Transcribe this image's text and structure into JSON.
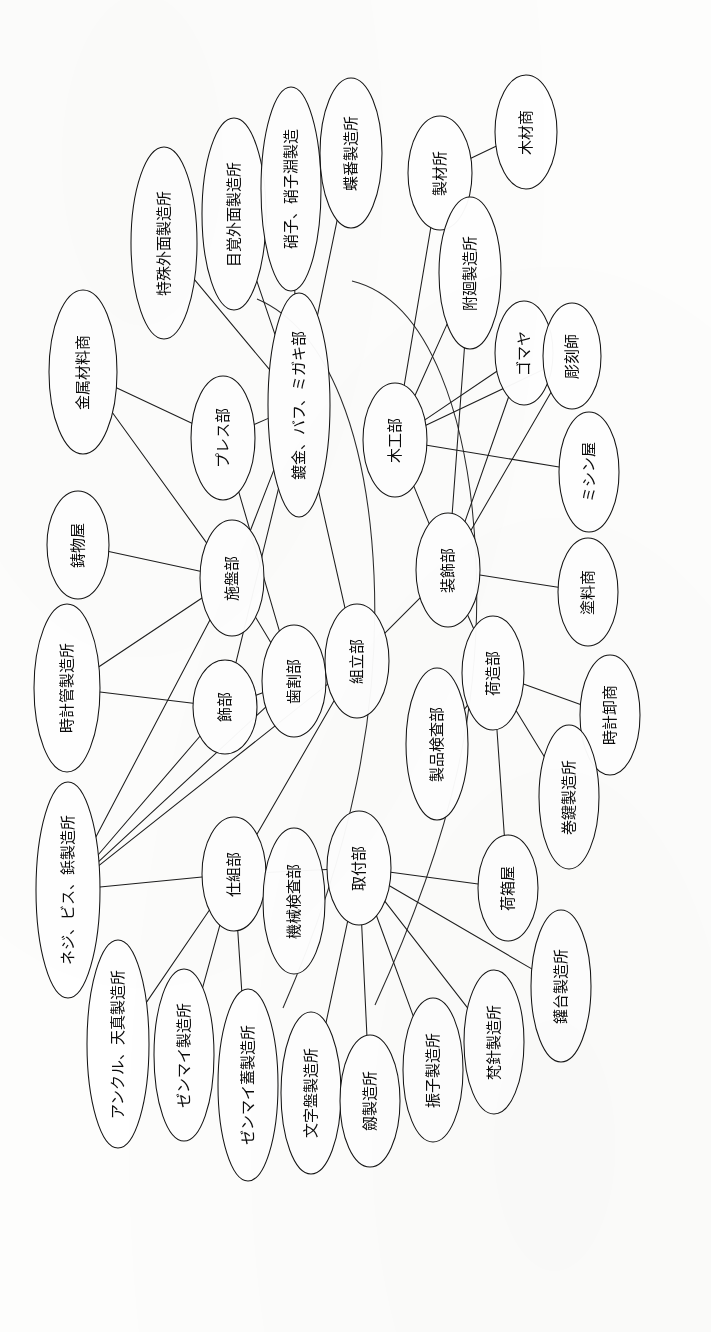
{
  "document": {
    "kind": "network-diagram",
    "orientation": "text-rotated-90-ccw",
    "background_color": "#fdfdfc",
    "ink_color": "#141414"
  },
  "chart_data": {
    "type": "diagram",
    "title": "",
    "nodes": [
      {
        "id": "n01",
        "label": "金属材料商",
        "cx": 83,
        "cy": 372,
        "rx": 34,
        "ry": 82,
        "fs": 15
      },
      {
        "id": "n02",
        "label": "特殊外面製造所",
        "cx": 164,
        "cy": 243,
        "rx": 33,
        "ry": 96,
        "fs": 15
      },
      {
        "id": "n03",
        "label": "目覚外面製造所",
        "cx": 234,
        "cy": 214,
        "rx": 32,
        "ry": 96,
        "fs": 15
      },
      {
        "id": "n04",
        "label": "硝子、硝子淵製造",
        "cx": 291,
        "cy": 189,
        "rx": 30,
        "ry": 102,
        "fs": 15
      },
      {
        "id": "n05",
        "label": "蝶番製造所",
        "cx": 351,
        "cy": 153,
        "rx": 31,
        "ry": 75,
        "fs": 15
      },
      {
        "id": "n06",
        "label": "製材所",
        "cx": 440,
        "cy": 173,
        "rx": 32,
        "ry": 57,
        "fs": 15
      },
      {
        "id": "n07",
        "label": "木材商",
        "cx": 526,
        "cy": 132,
        "rx": 31,
        "ry": 57,
        "fs": 15
      },
      {
        "id": "n08",
        "label": "附廻製造所",
        "cx": 470,
        "cy": 273,
        "rx": 31,
        "ry": 76,
        "fs": 15
      },
      {
        "id": "n09",
        "label": "ゴマヤ",
        "cx": 524,
        "cy": 353,
        "rx": 29,
        "ry": 52,
        "fs": 15
      },
      {
        "id": "n10",
        "label": "彫刻師",
        "cx": 572,
        "cy": 356,
        "rx": 29,
        "ry": 53,
        "fs": 15
      },
      {
        "id": "n11",
        "label": "鋳物屋",
        "cx": 78,
        "cy": 545,
        "rx": 31,
        "ry": 54,
        "fs": 15
      },
      {
        "id": "n12",
        "label": "プレス部",
        "cx": 223,
        "cy": 438,
        "rx": 32,
        "ry": 62,
        "fs": 15
      },
      {
        "id": "n13",
        "label": "鍍金、バフ、ミガキ部",
        "cx": 299,
        "cy": 405,
        "rx": 31,
        "ry": 112,
        "fs": 15
      },
      {
        "id": "n14",
        "label": "木工部",
        "cx": 395,
        "cy": 440,
        "rx": 32,
        "ry": 57,
        "fs": 15
      },
      {
        "id": "n15",
        "label": "ミシン屋",
        "cx": 589,
        "cy": 472,
        "rx": 30,
        "ry": 60,
        "fs": 15
      },
      {
        "id": "n16",
        "label": "施盤部",
        "cx": 232,
        "cy": 578,
        "rx": 32,
        "ry": 58,
        "fs": 15
      },
      {
        "id": "n17",
        "label": "時計管製造所",
        "cx": 67,
        "cy": 688,
        "rx": 33,
        "ry": 84,
        "fs": 15
      },
      {
        "id": "n18",
        "label": "装飾部",
        "cx": 448,
        "cy": 570,
        "rx": 32,
        "ry": 57,
        "fs": 15
      },
      {
        "id": "n19",
        "label": "塗料商",
        "cx": 588,
        "cy": 592,
        "rx": 30,
        "ry": 54,
        "fs": 15
      },
      {
        "id": "n20",
        "label": "飾部",
        "cx": 225,
        "cy": 707,
        "rx": 32,
        "ry": 47,
        "fs": 15
      },
      {
        "id": "n21",
        "label": "歯割部",
        "cx": 294,
        "cy": 681,
        "rx": 32,
        "ry": 56,
        "fs": 15
      },
      {
        "id": "n22",
        "label": "組立部",
        "cx": 357,
        "cy": 661,
        "rx": 32,
        "ry": 57,
        "fs": 15
      },
      {
        "id": "n23",
        "label": "荷造部",
        "cx": 493,
        "cy": 673,
        "rx": 31,
        "ry": 57,
        "fs": 15
      },
      {
        "id": "n24",
        "label": "時計卸商",
        "cx": 610,
        "cy": 715,
        "rx": 30,
        "ry": 60,
        "fs": 15
      },
      {
        "id": "n25",
        "label": "製品検査部",
        "cx": 437,
        "cy": 744,
        "rx": 31,
        "ry": 76,
        "fs": 15
      },
      {
        "id": "n26",
        "label": "巻鍵製造所",
        "cx": 569,
        "cy": 797,
        "rx": 30,
        "ry": 72,
        "fs": 15
      },
      {
        "id": "n27",
        "label": "ネジ、ビス、鋲製造所",
        "cx": 68,
        "cy": 890,
        "rx": 32,
        "ry": 108,
        "fs": 15
      },
      {
        "id": "n28",
        "label": "仕組部",
        "cx": 234,
        "cy": 874,
        "rx": 32,
        "ry": 57,
        "fs": 15
      },
      {
        "id": "n29",
        "label": "機械検査部",
        "cx": 294,
        "cy": 901,
        "rx": 31,
        "ry": 73,
        "fs": 15
      },
      {
        "id": "n30",
        "label": "取付部",
        "cx": 359,
        "cy": 868,
        "rx": 32,
        "ry": 57,
        "fs": 15
      },
      {
        "id": "n31",
        "label": "荷箱屋",
        "cx": 508,
        "cy": 888,
        "rx": 30,
        "ry": 53,
        "fs": 15
      },
      {
        "id": "n32",
        "label": "アンクル、天真製造所",
        "cx": 118,
        "cy": 1044,
        "rx": 31,
        "ry": 104,
        "fs": 15
      },
      {
        "id": "n33",
        "label": "ゼンマイ製造所",
        "cx": 184,
        "cy": 1055,
        "rx": 30,
        "ry": 86,
        "fs": 15
      },
      {
        "id": "n34",
        "label": "ゼンマイ蓋製造所",
        "cx": 248,
        "cy": 1085,
        "rx": 30,
        "ry": 96,
        "fs": 15
      },
      {
        "id": "n35",
        "label": "文字盤製造所",
        "cx": 311,
        "cy": 1093,
        "rx": 30,
        "ry": 81,
        "fs": 15
      },
      {
        "id": "n36",
        "label": "劔製造所",
        "cx": 370,
        "cy": 1101,
        "rx": 30,
        "ry": 66,
        "fs": 15
      },
      {
        "id": "n37",
        "label": "振子製造所",
        "cx": 433,
        "cy": 1070,
        "rx": 30,
        "ry": 72,
        "fs": 15
      },
      {
        "id": "n38",
        "label": "梵針製造所",
        "cx": 494,
        "cy": 1042,
        "rx": 30,
        "ry": 72,
        "fs": 15
      },
      {
        "id": "n39",
        "label": "鑵台製造所",
        "cx": 561,
        "cy": 986,
        "rx": 30,
        "ry": 76,
        "fs": 15
      }
    ],
    "edges": [
      {
        "from": "n06",
        "to": "n07",
        "kind": "straight"
      },
      {
        "from": "n01",
        "to": "n16",
        "kind": "straight"
      },
      {
        "from": "n01",
        "to": "n12",
        "kind": "straight"
      },
      {
        "from": "n02",
        "to": "n13",
        "kind": "straight"
      },
      {
        "from": "n03",
        "to": "n13",
        "kind": "straight"
      },
      {
        "from": "n04",
        "to": "n13",
        "kind": "straight"
      },
      {
        "from": "n05",
        "to": "n13",
        "kind": "straight"
      },
      {
        "from": "n11",
        "to": "n16",
        "kind": "straight"
      },
      {
        "from": "n17",
        "to": "n16",
        "kind": "straight"
      },
      {
        "from": "n17",
        "to": "n20",
        "kind": "straight"
      },
      {
        "from": "n16",
        "to": "n13",
        "kind": "straight"
      },
      {
        "from": "n16",
        "to": "n21",
        "kind": "straight"
      },
      {
        "from": "n12",
        "to": "n13",
        "kind": "straight"
      },
      {
        "from": "n12",
        "to": "n21",
        "kind": "straight"
      },
      {
        "from": "n20",
        "to": "n21",
        "kind": "straight"
      },
      {
        "from": "n20",
        "to": "n13",
        "kind": "straight"
      },
      {
        "from": "n21",
        "to": "n22",
        "kind": "straight"
      },
      {
        "from": "n22",
        "to": "n13",
        "kind": "straight"
      },
      {
        "from": "n22",
        "to": "n18",
        "kind": "straight"
      },
      {
        "from": "n22",
        "to": "n28",
        "kind": "straight"
      },
      {
        "from": "n06",
        "to": "n14",
        "kind": "straight"
      },
      {
        "from": "n08",
        "to": "n14",
        "kind": "straight"
      },
      {
        "from": "n08",
        "to": "n18",
        "kind": "straight"
      },
      {
        "from": "n14",
        "to": "n09",
        "kind": "straight"
      },
      {
        "from": "n14",
        "to": "n10",
        "kind": "straight"
      },
      {
        "from": "n14",
        "to": "n15",
        "kind": "straight"
      },
      {
        "from": "n14",
        "to": "n18",
        "kind": "straight"
      },
      {
        "from": "n18",
        "to": "n09",
        "kind": "straight"
      },
      {
        "from": "n18",
        "to": "n10",
        "kind": "straight"
      },
      {
        "from": "n18",
        "to": "n19",
        "kind": "straight"
      },
      {
        "from": "n18",
        "to": "n23",
        "kind": "straight"
      },
      {
        "from": "n23",
        "to": "n24",
        "kind": "straight"
      },
      {
        "from": "n23",
        "to": "n25",
        "kind": "straight"
      },
      {
        "from": "n23",
        "to": "n26",
        "kind": "straight"
      },
      {
        "from": "n23",
        "to": "n31",
        "kind": "straight"
      },
      {
        "from": "n27",
        "to": "n28",
        "kind": "straight"
      },
      {
        "from": "n27",
        "to": "n16",
        "kind": "straight"
      },
      {
        "from": "n27",
        "to": "n20",
        "kind": "straight"
      },
      {
        "from": "n27",
        "to": "n21",
        "kind": "straight"
      },
      {
        "from": "n27",
        "to": "n22",
        "kind": "straight"
      },
      {
        "from": "n28",
        "to": "n30",
        "kind": "straight"
      },
      {
        "from": "n28",
        "to": "n32",
        "kind": "straight"
      },
      {
        "from": "n28",
        "to": "n33",
        "kind": "straight"
      },
      {
        "from": "n28",
        "to": "n34",
        "kind": "straight"
      },
      {
        "from": "n30",
        "to": "n35",
        "kind": "straight"
      },
      {
        "from": "n30",
        "to": "n36",
        "kind": "straight"
      },
      {
        "from": "n30",
        "to": "n37",
        "kind": "straight"
      },
      {
        "from": "n30",
        "to": "n38",
        "kind": "straight"
      },
      {
        "from": "n30",
        "to": "n39",
        "kind": "straight"
      },
      {
        "from": "n30",
        "to": "n31",
        "kind": "straight"
      }
    ],
    "curves": [
      {
        "id": "c1",
        "d": "M 352,281 C 430,300 470,420 476,560 C 482,700 455,830 375,1005"
      },
      {
        "id": "c2",
        "d": "M 257,299 C 330,330 368,440 374,575 C 380,710 352,850 283,1008"
      }
    ],
    "layout": {
      "width": 711,
      "height": 1332,
      "text_rotation_deg": -90
    }
  },
  "legend": {
    "departments": [
      "プレス部",
      "鍍金、バフ、ミガキ部",
      "木工部",
      "施盤部",
      "装飾部",
      "飾部",
      "歯割部",
      "組立部",
      "荷造部",
      "製品検査部",
      "仕組部",
      "機械検査部",
      "取付部"
    ],
    "suppliers": [
      "金属材料商",
      "特殊外面製造所",
      "目覚外面製造所",
      "硝子、硝子淵製造",
      "蝶番製造所",
      "製材所",
      "木材商",
      "附廻製造所",
      "ゴマヤ",
      "彫刻師",
      "鋳物屋",
      "ミシン屋",
      "時計管製造所",
      "塗料商",
      "時計卸商",
      "巻鍵製造所",
      "ネジ、ビス、鋲製造所",
      "荷箱屋",
      "アンクル、天真製造所",
      "ゼンマイ製造所",
      "ゼンマイ蓋製造所",
      "文字盤製造所",
      "劔製造所",
      "振子製造所",
      "梵針製造所",
      "鑵台製造所"
    ]
  }
}
